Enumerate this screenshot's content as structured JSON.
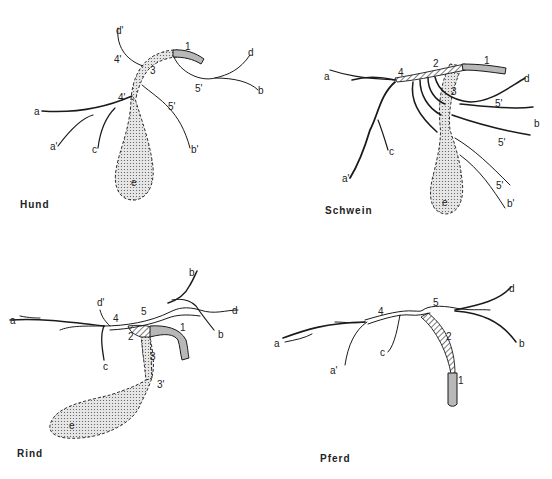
{
  "figure": {
    "panels": [
      {
        "id": "hund",
        "title": "Hund",
        "labels": [
          "1",
          "3",
          "4'",
          "4'",
          "5'",
          "5'",
          "a",
          "a'",
          "b",
          "b'",
          "c",
          "d",
          "d'",
          "e"
        ]
      },
      {
        "id": "schwein",
        "title": "Schwein",
        "labels": [
          "1",
          "2",
          "3",
          "4",
          "5'",
          "5'",
          "5'",
          "a",
          "a'",
          "b",
          "b'",
          "c",
          "d",
          "e"
        ]
      },
      {
        "id": "rind",
        "title": "Rind",
        "labels": [
          "1",
          "2",
          "3",
          "3'",
          "4",
          "5",
          "a",
          "b",
          "b",
          "c",
          "d",
          "d'",
          "e"
        ]
      },
      {
        "id": "pferd",
        "title": "Pferd",
        "labels": [
          "1",
          "2",
          "4",
          "5",
          "a",
          "a'",
          "b",
          "c",
          "d"
        ]
      }
    ]
  },
  "labels": {
    "hund": {
      "title": "Hund",
      "n1": "1",
      "n3": "3",
      "n4a": "4'",
      "n4b": "4'",
      "n5a": "5'",
      "n5b": "5'",
      "a": "a",
      "a2": "a'",
      "b": "b",
      "b2": "b'",
      "c": "c",
      "d": "d",
      "d2": "d'",
      "e": "e"
    },
    "schwein": {
      "title": "Schwein",
      "n1": "1",
      "n2": "2",
      "n3": "3",
      "n4": "4",
      "n5a": "5'",
      "n5b": "5'",
      "n5c": "5'",
      "a": "a",
      "a2": "a'",
      "b": "b",
      "b2": "b'",
      "c": "c",
      "d": "d",
      "e": "e"
    },
    "rind": {
      "title": "Rind",
      "n1": "1",
      "n2": "2",
      "n3": "3",
      "n3b": "3'",
      "n4": "4",
      "n5": "5",
      "a": "a",
      "b1": "b",
      "b2": "b",
      "c": "c",
      "d": "d",
      "d2": "d'",
      "e": "e"
    },
    "pferd": {
      "title": "Pferd",
      "n1": "1",
      "n2": "2",
      "n4": "4",
      "n5": "5",
      "a": "a",
      "a2": "a'",
      "b": "b",
      "c": "c",
      "d": "d"
    }
  },
  "colors": {
    "line": "#1a1a1a",
    "gallbladder_fill": "#d8d8d8",
    "duct_fill": "#b8b8b8",
    "background": "#ffffff"
  }
}
